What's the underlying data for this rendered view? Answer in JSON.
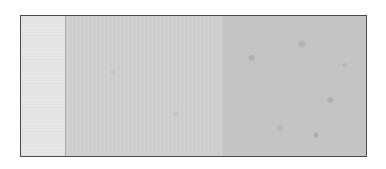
{
  "image": {
    "description": "Grey textured surface sample divided into three vertical bands inside a thin dark frame",
    "panels": [
      {
        "name": "light",
        "color": "#e6e6e6"
      },
      {
        "name": "medium",
        "color": "#cfcfcf"
      },
      {
        "name": "dark-speckled",
        "color": "#c4c4c4"
      }
    ],
    "border_color": "#4a4a4a"
  }
}
